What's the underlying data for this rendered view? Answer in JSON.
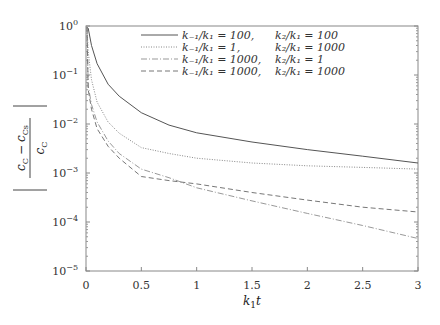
{
  "chart_data": {
    "type": "line",
    "title": "",
    "xlabel": "k1 t",
    "ylabel": "|(c_C - c_Cs) / c_C|",
    "xlim": [
      0,
      3
    ],
    "ylim": [
      1e-05,
      1
    ],
    "yscale": "log",
    "grid": false,
    "legend_position": "upper right",
    "x_ticks": [
      "0",
      "0.5",
      "1",
      "1.5",
      "2",
      "2.5",
      "3"
    ],
    "y_ticks": [
      "10^0",
      "10^-1",
      "10^-2",
      "10^-3",
      "10^-4",
      "10^-5"
    ],
    "x": [
      0.02,
      0.05,
      0.1,
      0.2,
      0.3,
      0.5,
      0.75,
      1.0,
      1.5,
      2.0,
      2.5,
      3.0
    ],
    "series": [
      {
        "name": "k-1/k1 = 100, k2/k1 = 100",
        "style": "solid",
        "color": "#555555",
        "values": [
          0.9,
          0.4,
          0.17,
          0.065,
          0.037,
          0.017,
          0.0095,
          0.0066,
          0.0043,
          0.003,
          0.0022,
          0.0016
        ]
      },
      {
        "name": "k-1/k1 = 1, k2/k1 = 1000",
        "style": "dotted",
        "color": "#888888",
        "values": [
          0.3,
          0.08,
          0.028,
          0.011,
          0.0065,
          0.0033,
          0.0025,
          0.002,
          0.0016,
          0.0014,
          0.0013,
          0.0012
        ]
      },
      {
        "name": "k-1/k1 = 1000, k2/k1 = 1",
        "style": "dash-dot",
        "color": "#999999",
        "values": [
          0.06,
          0.025,
          0.011,
          0.0045,
          0.0025,
          0.0012,
          0.0008,
          0.0005,
          0.00027,
          0.00015,
          8.5e-05,
          4.6e-05
        ]
      },
      {
        "name": "k-1/k1 = 1000, k2/k1 = 1000",
        "style": "dashed",
        "color": "#777777",
        "values": [
          0.05,
          0.02,
          0.008,
          0.0035,
          0.002,
          0.00085,
          0.0007,
          0.0006,
          0.0004,
          0.00028,
          0.0002,
          0.00016
        ]
      }
    ]
  },
  "axes": {
    "xlabel_main": "k",
    "xlabel_sub": "1",
    "xlabel_var": "t",
    "ylabel_num_a": "c",
    "ylabel_num_a_sub": "C",
    "ylabel_minus": "−",
    "ylabel_num_b": "c",
    "ylabel_num_b_sub": "Cs",
    "ylabel_den": "c",
    "ylabel_den_sub": "C"
  },
  "ticks": {
    "x": [
      {
        "label": "0",
        "value": 0
      },
      {
        "label": "0.5",
        "value": 0.5
      },
      {
        "label": "1",
        "value": 1
      },
      {
        "label": "1.5",
        "value": 1.5
      },
      {
        "label": "2",
        "value": 2
      },
      {
        "label": "2.5",
        "value": 2.5
      },
      {
        "label": "3",
        "value": 3
      }
    ],
    "y": [
      {
        "base": "10",
        "exp": "0",
        "value": 0
      },
      {
        "base": "10",
        "exp": "−1",
        "value": -1
      },
      {
        "base": "10",
        "exp": "−2",
        "value": -2
      },
      {
        "base": "10",
        "exp": "−3",
        "value": -3
      },
      {
        "base": "10",
        "exp": "−4",
        "value": -4
      },
      {
        "base": "10",
        "exp": "−5",
        "value": -5
      }
    ]
  },
  "legend": [
    {
      "left": "k₋₁/k₁ = 100,",
      "right": "k₂/k₁ = 100",
      "style": "solid"
    },
    {
      "left": "k₋₁/k₁ = 1,",
      "right": "k₂/k₁ = 1000",
      "style": "dotted"
    },
    {
      "left": "k₋₁/k₁ = 1000,",
      "right": "k₂/k₁ = 1",
      "style": "dash-dot"
    },
    {
      "left": "k₋₁/k₁ = 1000,",
      "right": "k₂/k₁ = 1000",
      "style": "dashed"
    }
  ]
}
